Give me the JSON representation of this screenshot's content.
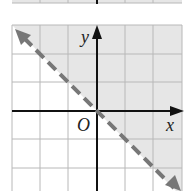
{
  "figure": {
    "type": "linear-inequality-graph",
    "inequality": "y > -x",
    "boundary_line": "y = -x",
    "boundary_style": "dashed",
    "shaded_side": "above",
    "axis_labels": {
      "x": "x",
      "y": "y",
      "origin": "O"
    },
    "grid": {
      "x_range": [
        -3,
        3
      ],
      "y_range": [
        -3,
        3
      ],
      "step": 1
    },
    "colors": {
      "shade": "#e6e6e6",
      "grid": "#b8b8b8",
      "axis": "#111111",
      "boundary": "#777777"
    }
  },
  "top_strip": {
    "description": "partial graph above, cut off"
  }
}
